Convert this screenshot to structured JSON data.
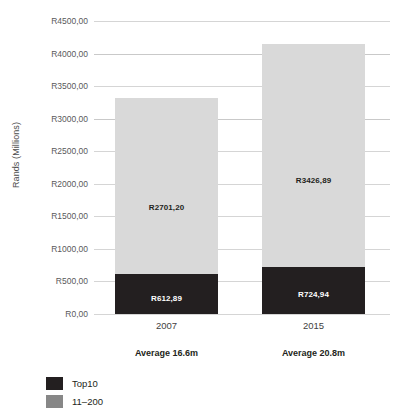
{
  "chart_data": {
    "type": "bar",
    "subtype": "stacked",
    "title": "",
    "xlabel": "",
    "ylabel": "Rands (Millions)",
    "categories": [
      "2007",
      "2015"
    ],
    "ylim": [
      0,
      4500
    ],
    "ytick_step": 500,
    "ytick_labels": [
      "R4500,00",
      "R4000,00",
      "R3500,00",
      "R3000,00",
      "R2500,00",
      "R2000,00",
      "R1500,00",
      "R1000,00",
      "R500,00",
      "R0,00"
    ],
    "ytick_values": [
      4500,
      4000,
      3500,
      3000,
      2500,
      2000,
      1500,
      1000,
      500,
      0
    ],
    "grid": true,
    "legend_position": "bottom-left",
    "series": [
      {
        "name": "Top10",
        "color": "#231f20",
        "values": [
          612.89,
          724.94
        ],
        "labels": [
          "R612,89",
          "R724,94"
        ]
      },
      {
        "name": "11–200",
        "color": "#d9d9d9",
        "legend_color": "#878787",
        "values": [
          2701.2,
          3426.89
        ],
        "labels": [
          "R2701,20",
          "R3426,89"
        ]
      }
    ],
    "totals": [
      3314.09,
      4151.83
    ],
    "annotations": [
      {
        "category": "2007",
        "text": "Average 16.6m"
      },
      {
        "category": "2015",
        "text": "Average 20.8m"
      }
    ]
  },
  "axis": {
    "y_title": "Rands (Millions)",
    "ticks": [
      {
        "label": "R4500,00",
        "value": 4500
      },
      {
        "label": "R4000,00",
        "value": 4000
      },
      {
        "label": "R3500,00",
        "value": 3500
      },
      {
        "label": "R3000,00",
        "value": 3000
      },
      {
        "label": "R2500,00",
        "value": 2500
      },
      {
        "label": "R2000,00",
        "value": 2000
      },
      {
        "label": "R1500,00",
        "value": 1500
      },
      {
        "label": "R1000,00",
        "value": 1000
      },
      {
        "label": "R500,00",
        "value": 500
      },
      {
        "label": "R0,00",
        "value": 0
      }
    ]
  },
  "bars": [
    {
      "category": "2007",
      "average": "Average 16.6m",
      "rest_label": "R2701,20",
      "top10_label": "R612,89",
      "rest_value": 2701.2,
      "top10_value": 612.89
    },
    {
      "category": "2015",
      "average": "Average 20.8m",
      "rest_label": "R3426,89",
      "top10_label": "R724,94",
      "rest_value": 3426.89,
      "top10_value": 724.94
    }
  ],
  "legend": {
    "items": [
      {
        "label": "Top10",
        "color": "#231f20"
      },
      {
        "label": "11–200",
        "color": "#878787"
      }
    ]
  }
}
